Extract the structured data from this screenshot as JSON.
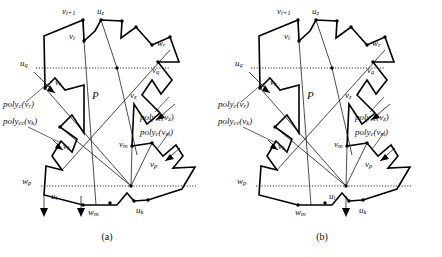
{
  "figure": {
    "type": "geometry-diagram",
    "panels": [
      {
        "id": "a",
        "caption": "(a)",
        "interior_label": "P",
        "vertex_labels": [
          {
            "key": "v_i1",
            "text": "v",
            "sub": "i+1"
          },
          {
            "key": "u_z",
            "text": "u",
            "sub": "z"
          },
          {
            "key": "v_i",
            "text": "v",
            "sub": "i"
          },
          {
            "key": "w_r",
            "text": "w",
            "sub": "r"
          },
          {
            "key": "u_q",
            "text": "u",
            "sub": "q"
          },
          {
            "key": "v_q",
            "text": "v",
            "sub": "q"
          },
          {
            "key": "v_r",
            "text": "v",
            "sub": "r"
          },
          {
            "key": "v_z",
            "text": "v",
            "sub": "z"
          },
          {
            "key": "v_k",
            "text": "v",
            "sub": "k"
          },
          {
            "key": "v_m",
            "text": "v",
            "sub": "m"
          },
          {
            "key": "v_p",
            "text": "v",
            "sub": "p"
          },
          {
            "key": "w_p",
            "text": "w",
            "sub": "p"
          },
          {
            "key": "u_i",
            "text": "u",
            "sub": "i"
          },
          {
            "key": "w_m",
            "text": "w",
            "sub": "m"
          },
          {
            "key": "u_k",
            "text": "u",
            "sub": "k"
          }
        ],
        "annotations": [
          {
            "key": "poly_c_vr",
            "name": "poly",
            "sub": "c",
            "arg": "v",
            "argsub": "r"
          },
          {
            "key": "poly_cc_vk",
            "name": "poly",
            "sub": "cc",
            "arg": "v",
            "argsub": "k"
          },
          {
            "key": "poly_cc_vz",
            "name": "poly",
            "sub": "cc",
            "arg": "v",
            "argsub": "z"
          },
          {
            "key": "poly_c_vm",
            "name": "poly",
            "sub": "c",
            "arg": "v",
            "argsub": "m"
          }
        ]
      },
      {
        "id": "b",
        "caption": "(b)",
        "interior_label": "P",
        "vertex_labels": [
          {
            "key": "v_i1",
            "text": "v",
            "sub": "i+1"
          },
          {
            "key": "u_z",
            "text": "u",
            "sub": "z"
          },
          {
            "key": "v_i",
            "text": "v",
            "sub": "i"
          },
          {
            "key": "w_r",
            "text": "w",
            "sub": "r"
          },
          {
            "key": "u_q",
            "text": "u",
            "sub": "q"
          },
          {
            "key": "v_q",
            "text": "v",
            "sub": "q"
          },
          {
            "key": "v_r",
            "text": "v",
            "sub": "r"
          },
          {
            "key": "v_z",
            "text": "v",
            "sub": "z"
          },
          {
            "key": "v_k",
            "text": "v",
            "sub": "k"
          },
          {
            "key": "v_m",
            "text": "v",
            "sub": "m"
          },
          {
            "key": "v_p",
            "text": "v",
            "sub": "p"
          },
          {
            "key": "w_p",
            "text": "w",
            "sub": "p"
          },
          {
            "key": "u_i",
            "text": "u",
            "sub": "i"
          },
          {
            "key": "w_m",
            "text": "w",
            "sub": "m"
          },
          {
            "key": "u_k",
            "text": "u",
            "sub": "k"
          }
        ],
        "annotations": [
          {
            "key": "poly_c_vr",
            "name": "poly",
            "sub": "c",
            "arg": "v",
            "argsub": "r"
          },
          {
            "key": "poly_cc_vk",
            "name": "poly",
            "sub": "cc",
            "arg": "v",
            "argsub": "k"
          },
          {
            "key": "poly_cc_vz",
            "name": "poly",
            "sub": "cc",
            "arg": "v",
            "argsub": "z"
          },
          {
            "key": "poly_c_vm",
            "name": "poly",
            "sub": "c",
            "arg": "v",
            "argsub": "m"
          }
        ]
      }
    ],
    "colors": {
      "stroke": "#000000",
      "shade": "#d9d9d9",
      "background": "#ffffff"
    }
  }
}
